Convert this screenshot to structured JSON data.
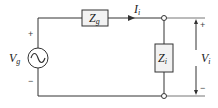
{
  "diagram": {
    "type": "circuit",
    "source": {
      "symbol": "V",
      "subscript": "g",
      "kind": "ac-voltage-source",
      "plus": "+",
      "minus": "−"
    },
    "series_impedance": {
      "symbol": "Z",
      "subscript": "g"
    },
    "current": {
      "symbol": "I",
      "subscript": "i"
    },
    "load_impedance": {
      "symbol": "Z",
      "subscript": "i"
    },
    "output_voltage": {
      "symbol": "V",
      "subscript": "i",
      "plus": "+",
      "minus": "−"
    }
  },
  "colors": {
    "wire": "#333333",
    "box_fill": "#f2f2f2",
    "background": "#ffffff"
  }
}
